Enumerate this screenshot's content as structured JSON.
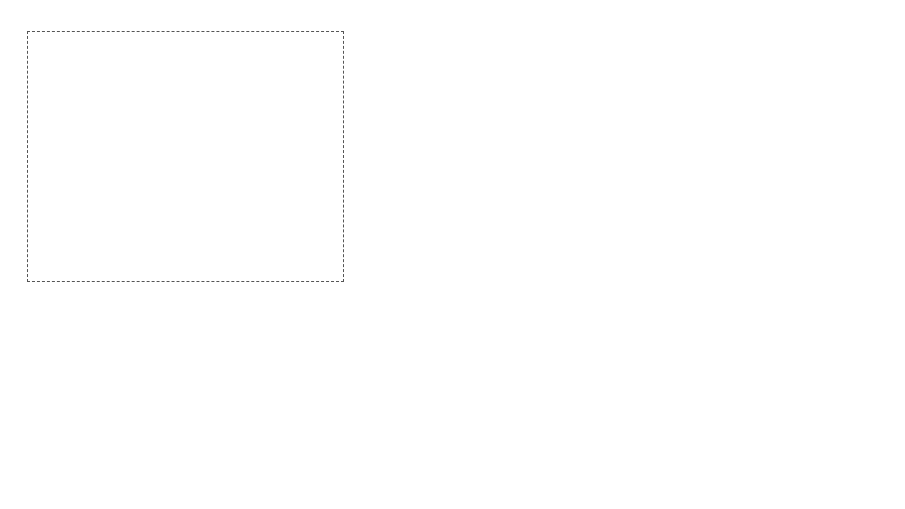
{
  "domains": {
    "event_instigation": {
      "title": "Event instigation domain"
    },
    "fully_developed": {
      "title": "Fully developed fire and structural response domain"
    }
  },
  "events": {
    "ignition": {
      "text": "Fire ignition in building",
      "prob_symbol": "p",
      "prob_sub": "ig"
    },
    "occupants": {
      "text": "Occupants fail to control the fire",
      "prob_symbol": "p",
      "prob_sub": "f,u"
    },
    "sprinklers": {
      "text": "Sprinklers fail to operate successfully",
      "prob_symbol": "p",
      "prob_sub": "f,s"
    },
    "rescue": {
      "text": "Fire & rescue service intervention is unsuccessful",
      "prob_symbol": "p",
      "prob_sub": "flb"
    },
    "structural": {
      "text": "Structural fails when subject to a fully developed fire",
      "prob_symbol": "P",
      "prob_sub": "f,fi"
    },
    "fully_developed_fire": {
      "text": "Fire becomes fully-developed"
    },
    "outcome": {
      "text": "Probability of fire induced structural failure in one year reference period"
    }
  },
  "gates": {
    "gate1": {
      "label": "AND"
    },
    "gate2": {
      "label": "AND"
    }
  },
  "formulas": {
    "pfi": {
      "lhs": "P",
      "lhs_sub": "fi",
      "eq": " = ",
      "t1": "P",
      "t1_sub": "ig",
      "p1": "+ ",
      "t2": "P",
      "t2_sub": "f,ti",
      "p2": " + ",
      "t3": "P",
      "t3_sub": "f,s",
      "p3": " + ",
      "t4": "P",
      "t4_sub": "f,lb"
    },
    "pf1": {
      "lhs": "P",
      "lhs_sub": "f,1",
      "eq": " = ",
      "t1": "P",
      "t1_sub": "f,fi",
      "p1": "+ ",
      "t2": "P",
      "t2_sub": "fi"
    }
  },
  "colors": {
    "line": "#444444",
    "gate_top": "#9a9a9a",
    "gate_bottom": "#6e6e6e"
  }
}
